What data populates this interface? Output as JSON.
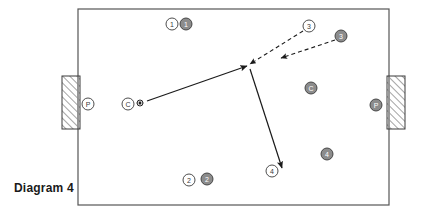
{
  "caption": {
    "text": "Diagram 4"
  },
  "colors": {
    "field_border": "#555555",
    "line": "#1a1a1a",
    "open_marker_stroke": "#3a3a3a",
    "open_marker_fill": "#ffffff",
    "filled_marker_fill": "#8c8c8c",
    "filled_marker_stroke": "#3a3a3a",
    "filled_marker_text": "#ffffff",
    "goal_hatch": "#8c8c8c",
    "goal_border": "#3a3a3a"
  },
  "field": {
    "name": "playing-field",
    "x": 78,
    "y": 9,
    "width": 311,
    "height": 196
  },
  "goals": [
    {
      "name": "goal-left",
      "x": 62,
      "y": 76,
      "width": 18,
      "height": 53
    },
    {
      "name": "goal-right",
      "x": 387,
      "y": 76,
      "width": 18,
      "height": 53
    }
  ],
  "markers": [
    {
      "name": "player-open-1",
      "label": "1",
      "style": "open",
      "cx": 172,
      "cy": 24,
      "r": 6
    },
    {
      "name": "player-filled-1",
      "label": "1",
      "style": "filled",
      "cx": 186,
      "cy": 24,
      "r": 6
    },
    {
      "name": "player-open-3",
      "label": "3",
      "style": "open",
      "cx": 309,
      "cy": 26,
      "r": 6
    },
    {
      "name": "player-filled-3",
      "label": "3",
      "style": "filled",
      "cx": 341,
      "cy": 36,
      "r": 6
    },
    {
      "name": "player-open-p-left",
      "label": "P",
      "style": "open",
      "cx": 88,
      "cy": 104,
      "r": 6
    },
    {
      "name": "player-filled-p-right",
      "label": "P",
      "style": "filled",
      "cx": 376,
      "cy": 105,
      "r": 6
    },
    {
      "name": "player-open-c",
      "label": "C",
      "style": "open",
      "cx": 128,
      "cy": 104,
      "r": 6
    },
    {
      "name": "player-filled-c",
      "label": "C",
      "style": "filled",
      "cx": 311,
      "cy": 88,
      "r": 6
    },
    {
      "name": "player-open-2",
      "label": "2",
      "style": "open",
      "cx": 189,
      "cy": 180,
      "r": 6
    },
    {
      "name": "player-filled-2",
      "label": "2",
      "style": "filled",
      "cx": 207,
      "cy": 179,
      "r": 6
    },
    {
      "name": "player-open-4",
      "label": "4",
      "style": "open",
      "cx": 272,
      "cy": 171,
      "r": 6
    },
    {
      "name": "player-filled-4",
      "label": "4",
      "style": "filled",
      "cx": 327,
      "cy": 154,
      "r": 6
    }
  ],
  "ball": {
    "name": "ball",
    "cx": 140,
    "cy": 103,
    "r": 3
  },
  "arrows": [
    {
      "name": "pass-arrow-c-to-center",
      "style": "solid",
      "from": {
        "x": 147,
        "y": 101
      },
      "to": {
        "x": 247,
        "y": 66
      }
    },
    {
      "name": "run-arrow-3-to-center",
      "style": "dashed",
      "from": {
        "x": 303,
        "y": 31
      },
      "to": {
        "x": 250,
        "y": 64
      }
    },
    {
      "name": "run-arrow-filled3-to-midright",
      "style": "dashed",
      "from": {
        "x": 335,
        "y": 40
      },
      "to": {
        "x": 281,
        "y": 58
      }
    },
    {
      "name": "run-arrow-center-to-4",
      "style": "solid",
      "from": {
        "x": 250,
        "y": 69
      },
      "to": {
        "x": 282,
        "y": 168
      }
    }
  ]
}
